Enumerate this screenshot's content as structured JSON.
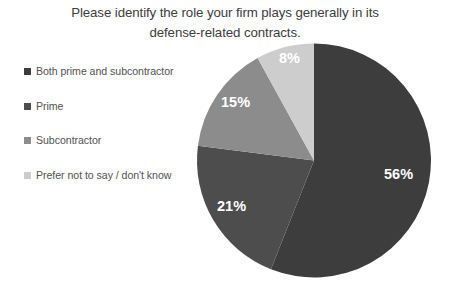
{
  "chart_data": {
    "type": "pie",
    "title": "Please identify the role your firm plays generally in its\ndefense-related contracts.",
    "categories": [
      "Both prime and subcontractor",
      "Prime",
      "Subcontractor",
      "Prefer not to say / don't know"
    ],
    "values": [
      56,
      21,
      15,
      8
    ],
    "value_labels": [
      "56%",
      "21%",
      "15%",
      "8%"
    ],
    "colors": [
      "#3d3d3d",
      "#4d4d4d",
      "#8c8c8c",
      "#cdcdcd"
    ],
    "legend_position": "left",
    "grid": false,
    "xlabel": "",
    "ylabel": "",
    "start_angle_deg": 0,
    "direction": "clockwise",
    "units": "percent"
  },
  "legend": {
    "items": [
      {
        "label": "Both prime and\nsubcontractor",
        "color": "#3d3d3d",
        "value_label": "56%"
      },
      {
        "label": "Prime",
        "color": "#4d4d4d",
        "value_label": "21%"
      },
      {
        "label": "Subcontractor",
        "color": "#8c8c8c",
        "value_label": "15%"
      },
      {
        "label": "Prefer not to say / don't\nknow",
        "color": "#cdcdcd",
        "value_label": "8%"
      }
    ]
  }
}
